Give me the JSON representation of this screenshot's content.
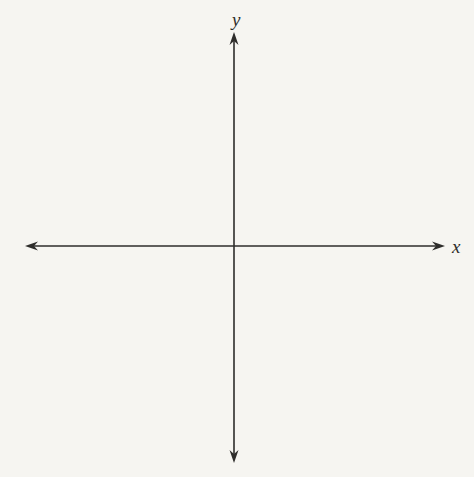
{
  "diagram": {
    "type": "coordinate-axes",
    "x_axis_label": "x",
    "y_axis_label": "y",
    "line_color": "#2e2d2b",
    "label_color": "#2e2d2b",
    "background_color": "#f6f5f1",
    "origin": {
      "x": 234,
      "y": 246
    },
    "x_axis_extent": {
      "left_tip_x": 25,
      "right_tip_x": 445
    },
    "y_axis_extent": {
      "top_tip_y": 32,
      "bottom_tip_y": 463
    }
  }
}
